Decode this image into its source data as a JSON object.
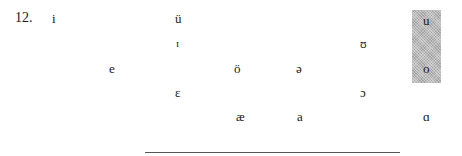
{
  "exercise": {
    "number": "12."
  },
  "vowels": [
    {
      "symbol": "i",
      "name": "vowel-i",
      "x": 52,
      "y": 12
    },
    {
      "symbol": "ü",
      "name": "vowel-u-umlaut",
      "x": 175,
      "y": 12
    },
    {
      "symbol": "u",
      "name": "vowel-u",
      "x": 423,
      "y": 14
    },
    {
      "symbol": "ɪ",
      "name": "vowel-small-cap-i",
      "x": 176,
      "y": 38
    },
    {
      "symbol": "ʊ",
      "name": "vowel-upsilon",
      "x": 360,
      "y": 38
    },
    {
      "symbol": "e",
      "name": "vowel-e",
      "x": 109,
      "y": 62
    },
    {
      "symbol": "ö",
      "name": "vowel-o-umlaut",
      "x": 234,
      "y": 62
    },
    {
      "symbol": "ə",
      "name": "vowel-schwa",
      "x": 296,
      "y": 62
    },
    {
      "symbol": "o",
      "name": "vowel-o",
      "x": 423,
      "y": 62
    },
    {
      "symbol": "ɛ",
      "name": "vowel-epsilon",
      "x": 175,
      "y": 86
    },
    {
      "symbol": "ɔ",
      "name": "vowel-open-o",
      "x": 360,
      "y": 86
    },
    {
      "symbol": "æ",
      "name": "vowel-ash",
      "x": 236,
      "y": 110
    },
    {
      "symbol": "a",
      "name": "vowel-a",
      "x": 297,
      "y": 110
    },
    {
      "symbol": "ɑ",
      "name": "vowel-script-a",
      "x": 423,
      "y": 110
    }
  ],
  "highlight": {
    "color": "#b8b8b8",
    "covers": [
      "u",
      "o"
    ]
  },
  "answer_line": {
    "color": "#555555"
  }
}
